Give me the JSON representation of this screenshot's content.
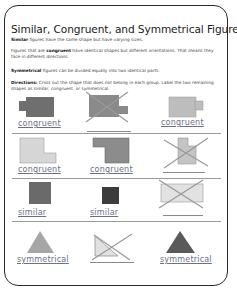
{
  "title": "Similar, Congruent, and Symmetrical Figures",
  "definitions": {
    "similar": {
      "term": "Similar",
      "text": " figures have the same shape but have varying sizes."
    },
    "congruent": {
      "prefix": "Figures that are ",
      "term": "congruent",
      "text": " have identical shapes but different orientations. That means they face in different directions."
    },
    "symmetrical": {
      "term": "Symmetrical",
      "text": " figures can be divided equally into two identical parts."
    }
  },
  "directions": {
    "term": "Directions:",
    "text": " Cross out the shape that does not belong in each group. Label the two remaining shapes as similar, congruent, or symmetrical."
  },
  "rows": [
    {
      "items": [
        {
          "shape": "rect-with-tab-left",
          "color": "#6f6f6f",
          "crossed": false,
          "label": "congruent"
        },
        {
          "shape": "rect-with-tab-right",
          "color": "#8a8a8a",
          "crossed": true,
          "label": ""
        },
        {
          "shape": "rect-with-tab-right",
          "color": "#bdbdbd",
          "crossed": false,
          "label": "congruent"
        }
      ]
    },
    {
      "items": [
        {
          "shape": "l-shape",
          "color": "#d6d6d6",
          "crossed": false,
          "label": "congruent"
        },
        {
          "shape": "l-shape-rotated",
          "color": "#8c8c8c",
          "crossed": false,
          "label": "congruent"
        },
        {
          "shape": "notched-square",
          "color": "#c4c4c4",
          "crossed": true,
          "label": ""
        }
      ]
    },
    {
      "items": [
        {
          "shape": "square",
          "color": "#6a6a6a",
          "crossed": false,
          "label": "similar"
        },
        {
          "shape": "square-small",
          "color": "#3c3c3c",
          "crossed": false,
          "label": "similar"
        },
        {
          "shape": "rectangle",
          "color": "#e2e2e2",
          "crossed": true,
          "label": ""
        }
      ]
    },
    {
      "items": [
        {
          "shape": "triangle",
          "color": "#a6a6a6",
          "crossed": false,
          "label": "symmetrical"
        },
        {
          "shape": "right-triangle",
          "color": "#e0e0e0",
          "crossed": true,
          "label": ""
        },
        {
          "shape": "triangle",
          "color": "#5a5a5a",
          "crossed": false,
          "label": "symmetrical"
        }
      ]
    }
  ],
  "colors": {
    "label": "#6a6f8a",
    "frame": "#2a2a2a",
    "divider": "#9a9a9a"
  }
}
